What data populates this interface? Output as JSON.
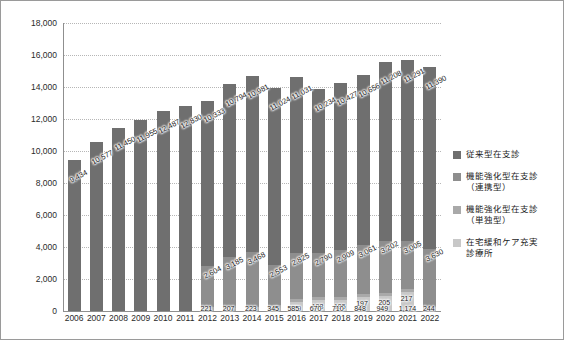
{
  "chart_data": {
    "type": "bar",
    "subtype": "stacked-bar",
    "title": "",
    "xlabel": "",
    "ylabel": "",
    "ylim": [
      0,
      18000
    ],
    "ytick_step": 2000,
    "ytick_labels": [
      "0",
      "2,000",
      "4,000",
      "6,000",
      "8,000",
      "10,000",
      "12,000",
      "14,000",
      "16,000",
      "18,000"
    ],
    "ytick_values": [
      0,
      2000,
      4000,
      6000,
      8000,
      10000,
      12000,
      14000,
      16000,
      18000
    ],
    "grid": true,
    "grid_style": "dotted horizontal",
    "legend_position": "right",
    "categories": [
      "2006",
      "2007",
      "2008",
      "2009",
      "2010",
      "2011",
      "2012",
      "2013",
      "2014",
      "2015",
      "2016",
      "2017",
      "2018",
      "2019",
      "2020",
      "2021",
      "2022"
    ],
    "series": [
      {
        "name": "従来型在支診",
        "color": "#6f6f6f",
        "values": [
          9434,
          10577,
          11450,
          11955,
          12487,
          12830,
          10333,
          10794,
          10981,
          11024,
          11031,
          10234,
          10427,
          10656,
          11208,
          11291,
          11390
        ],
        "labels": [
          "9,434",
          "10,577",
          "11,450",
          "11,955",
          "12,487",
          "12,830",
          "10,333",
          "10,794",
          "10,981",
          "11,024",
          "11,031",
          "10,234",
          "10,427",
          "10,656",
          "11,208",
          "11,291",
          "11,390"
        ]
      },
      {
        "name": "機能強化型在支診（連携型）",
        "color": "#8e8e8e",
        "values": [
          null,
          null,
          null,
          null,
          null,
          null,
          2604,
          3185,
          3468,
          2553,
          2825,
          2790,
          2909,
          3061,
          3202,
          3005,
          3630
        ],
        "labels": [
          "",
          "",
          "",
          "",
          "",
          "",
          "2,604",
          "3,185",
          "3,468",
          "2,553",
          "2,825",
          "2,790",
          "2,909",
          "3,061",
          "3,202",
          "3,005",
          "3,630"
        ]
      },
      {
        "name": "機能強化型在支診（単独型）",
        "color": "#a9a9a9",
        "values": [
          null,
          null,
          null,
          null,
          null,
          null,
          221,
          207,
          223,
          345,
          189,
          188,
          185,
          197,
          205,
          217,
          244
        ],
        "labels": [
          "",
          "",
          "",
          "",
          "",
          "",
          "221",
          "207",
          "223",
          "345",
          "189",
          "188",
          "185",
          "197",
          "205",
          "217",
          "244"
        ]
      },
      {
        "name": "在宅緩和ケア充実診療所",
        "color": "#c8c8c8",
        "values": [
          null,
          null,
          null,
          null,
          null,
          null,
          null,
          null,
          null,
          null,
          585,
          670,
          710,
          848,
          949,
          1174,
          null
        ],
        "labels": [
          "",
          "",
          "",
          "",
          "",
          "",
          "",
          "",
          "",
          "",
          "585",
          "670",
          "710",
          "848",
          "949",
          "1,174",
          ""
        ]
      }
    ],
    "bottom_labels": [
      "",
      "",
      "",
      "",
      "",
      "",
      "221",
      "207",
      "223",
      "345",
      "189",
      "585",
      "670",
      "710",
      "848",
      "949",
      "1,174"
    ]
  },
  "legend": {
    "items": [
      {
        "label_line1": "従来型在支診",
        "label_line2": "",
        "color": "#6f6f6f"
      },
      {
        "label_line1": "機能強化型在支診",
        "label_line2": "（連携型）",
        "color": "#8e8e8e"
      },
      {
        "label_line1": "機能強化型在支診",
        "label_line2": "（単独型）",
        "color": "#a9a9a9"
      },
      {
        "label_line1": "在宅緩和ケア充実",
        "label_line2": "診療所",
        "color": "#c8c8c8"
      }
    ]
  }
}
